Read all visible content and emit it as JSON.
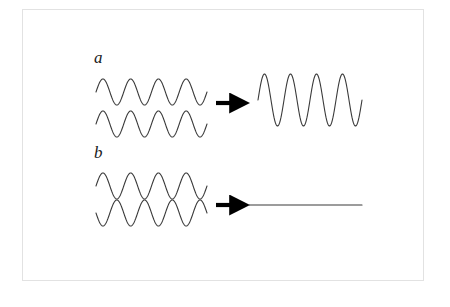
{
  "figure": {
    "background_color": "#ffffff",
    "border_color": "#e2e2e2",
    "stroke_color": "#3a3a3a",
    "arrow_color": "#000000",
    "panels": [
      {
        "id": "a",
        "label": "a",
        "interference_type": "constructive",
        "input_waves": [
          {
            "name": "input-wave-a-top",
            "x_start": 96,
            "x_end": 207,
            "baseline_y": 92,
            "amplitude": 13,
            "cycles": 4,
            "phase_deg": 0
          },
          {
            "name": "input-wave-a-bottom",
            "x_start": 96,
            "x_end": 207,
            "baseline_y": 124,
            "amplitude": 13,
            "cycles": 4,
            "phase_deg": 0
          }
        ],
        "arrow": {
          "name": "arrow-a",
          "x_start": 216,
          "x_end": 236,
          "y": 103,
          "direction": "right"
        },
        "output_wave": {
          "name": "output-wave-a",
          "x_start": 258,
          "x_end": 362,
          "baseline_y": 100,
          "amplitude": 26,
          "cycles": 4,
          "phase_deg": 0
        }
      },
      {
        "id": "b",
        "label": "b",
        "interference_type": "destructive",
        "input_waves": [
          {
            "name": "input-wave-b-top",
            "x_start": 96,
            "x_end": 207,
            "baseline_y": 186,
            "amplitude": 13,
            "cycles": 4,
            "phase_deg": 0
          },
          {
            "name": "input-wave-b-bottom",
            "x_start": 96,
            "x_end": 207,
            "baseline_y": 213,
            "amplitude": 13,
            "cycles": 4,
            "phase_deg": 180
          }
        ],
        "arrow": {
          "name": "arrow-b",
          "x_start": 216,
          "x_end": 236,
          "y": 205,
          "direction": "right"
        },
        "output_wave": {
          "name": "output-flat-line-b",
          "x_start": 249,
          "x_end": 362,
          "baseline_y": 205,
          "amplitude": 0,
          "cycles": 0,
          "phase_deg": 0
        }
      }
    ]
  }
}
